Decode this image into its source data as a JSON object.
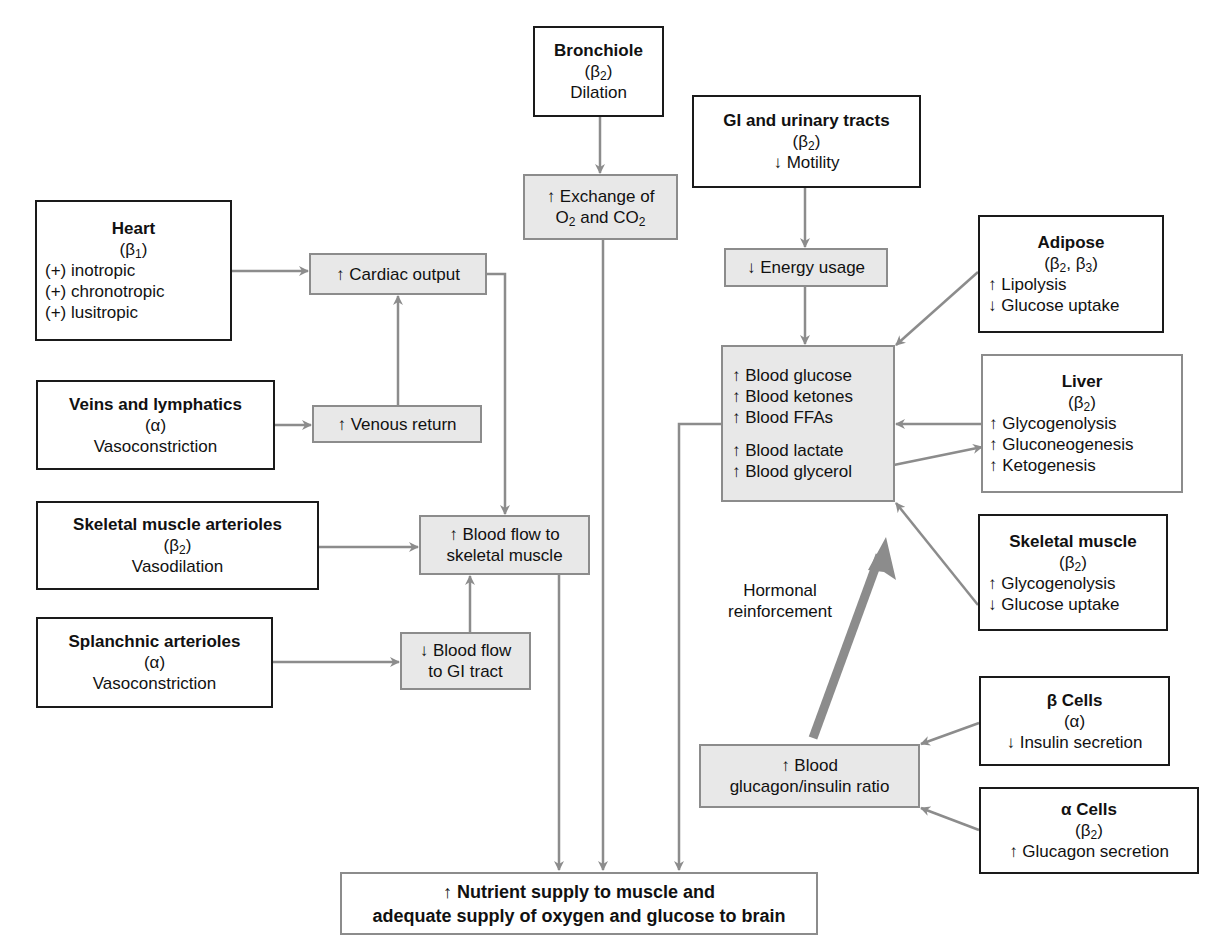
{
  "diagram": {
    "colors": {
      "connector": "#8c8c8c",
      "source_border": "#1a1a1a",
      "effect_fill": "#e8e8e8",
      "background": "#ffffff"
    },
    "sources": {
      "bronchiole": {
        "title": "Bronchiole",
        "receptor_pre": "(β",
        "receptor_sub": "2",
        "receptor_post": ")",
        "effects": [
          "Dilation"
        ]
      },
      "gi_urinary": {
        "title": "GI and urinary tracts",
        "receptor_pre": "(β",
        "receptor_sub": "2",
        "receptor_post": ")",
        "effects": [
          "↓ Motility"
        ]
      },
      "heart": {
        "title": "Heart",
        "receptor_pre": "(β",
        "receptor_sub": "1",
        "receptor_post": ")",
        "effects": [
          "(+) inotropic",
          "(+) chronotropic",
          "(+) lusitropic"
        ]
      },
      "veins": {
        "title": "Veins and lymphatics",
        "receptor": "(α)",
        "effects": [
          "Vasoconstriction"
        ]
      },
      "skeletal_arterioles": {
        "title": "Skeletal muscle arterioles",
        "receptor_pre": "(β",
        "receptor_sub": "2",
        "receptor_post": ")",
        "effects": [
          "Vasodilation"
        ]
      },
      "splanchnic": {
        "title": "Splanchnic arterioles",
        "receptor": "(α)",
        "effects": [
          "Vasoconstriction"
        ]
      },
      "adipose": {
        "title": "Adipose",
        "receptor_pre": "(β",
        "receptor_sub": "2",
        "receptor_mid": ", β",
        "receptor_sub2": "3",
        "receptor_post": ")",
        "effects": [
          "↑ Lipolysis",
          "↓ Glucose uptake"
        ]
      },
      "liver": {
        "title": "Liver",
        "receptor_pre": "(β",
        "receptor_sub": "2",
        "receptor_post": ")",
        "effects": [
          "↑ Glycogenolysis",
          "↑ Gluconeogenesis",
          "↑ Ketogenesis"
        ]
      },
      "skeletal_muscle": {
        "title": "Skeletal muscle",
        "receptor_pre": "(β",
        "receptor_sub": "2",
        "receptor_post": ")",
        "effects": [
          "↑ Glycogenolysis",
          "↓ Glucose uptake"
        ]
      },
      "beta_cells": {
        "title": "β Cells",
        "receptor": "(α)",
        "effects": [
          "↓ Insulin secretion"
        ]
      },
      "alpha_cells": {
        "title": "α Cells",
        "receptor_pre": "(β",
        "receptor_sub": "2",
        "receptor_post": ")",
        "effects": [
          "↑ Glucagon secretion"
        ]
      }
    },
    "effects": {
      "exchange": {
        "line1": "↑ Exchange of",
        "l2_a": "O",
        "l2_a_sub": "2",
        "l2_b": " and CO",
        "l2_b_sub": "2"
      },
      "energy": {
        "text": "↓ Energy usage"
      },
      "cardiac": {
        "text": "↑ Cardiac output"
      },
      "venous": {
        "text": "↑ Venous return"
      },
      "blood_flow_skeletal": {
        "lines": [
          "↑ Blood flow to",
          "skeletal muscle"
        ]
      },
      "blood_flow_gi": {
        "lines": [
          "↓ Blood flow",
          "to GI tract"
        ]
      },
      "metabolites": {
        "group1": [
          "↑ Blood glucose",
          "↑ Blood ketones",
          "↑ Blood FFAs"
        ],
        "group2": [
          "↑ Blood lactate",
          "↑ Blood glycerol"
        ]
      },
      "glucagon_ratio": {
        "lines": [
          "↑ Blood",
          "glucagon/insulin ratio"
        ]
      }
    },
    "outcome": {
      "lines": [
        "↑ Nutrient supply to muscle and",
        "adequate supply of oxygen and glucose to brain"
      ]
    },
    "annotations": {
      "hormonal": [
        "Hormonal",
        "reinforcement"
      ]
    }
  }
}
